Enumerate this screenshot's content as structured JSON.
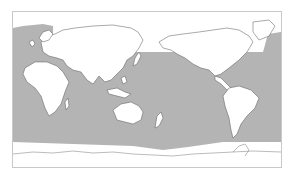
{
  "map": {
    "type": "world-map",
    "projection": "equirectangular, Pacific-centered",
    "colors": {
      "shaded_ocean": "#b4b4b4",
      "land": "#ffffff",
      "unshaded_region": "#ffffff",
      "coastline": "#555555",
      "frame": "#c8c8c8"
    },
    "regions": {
      "shaded": "ocean band between roughly 60°N (Atlantic/Pacific) and ~60°S",
      "unshaded": [
        "Arctic",
        "Southern Ocean / Antarctica margin",
        "land masses"
      ]
    },
    "landmasses": [
      "Europe",
      "Africa",
      "Asia",
      "Australia",
      "New Zealand",
      "Indonesia",
      "Japan",
      "North America",
      "Greenland",
      "Central America",
      "South America",
      "Antarctica"
    ]
  }
}
